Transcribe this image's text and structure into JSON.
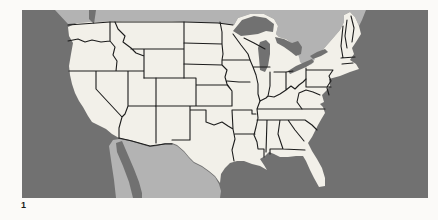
{
  "figure": {
    "label": "1"
  },
  "map": {
    "colors": {
      "page_bg": "#fbfaf8",
      "ocean": "#717171",
      "neighbor_land": "#b3b3b3",
      "us_land": "#f2f0e9",
      "state_border": "#1c1c1c"
    },
    "regions": {
      "country": "United States",
      "neighbors": [
        "Canada",
        "Mexico"
      ],
      "water_bodies": [
        "Pacific Ocean",
        "Atlantic Ocean",
        "Gulf of Mexico",
        "Gulf of California",
        "Puget Sound",
        "Lake Superior",
        "Lake Michigan",
        "Lake Huron",
        "Lake Erie",
        "Lake Ontario"
      ]
    }
  }
}
